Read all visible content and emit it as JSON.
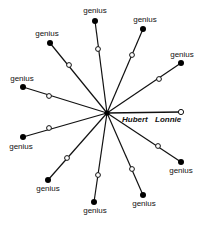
{
  "diagram": {
    "center": {
      "x": 107,
      "y": 113
    },
    "center_person": {
      "labels": [
        "Hubert",
        "Lonnie"
      ],
      "end": {
        "x": 181,
        "y": 112
      }
    },
    "spokes": [
      {
        "label": "genius",
        "dot": {
          "x": 95,
          "y": 21
        },
        "open": {
          "x": 98,
          "y": 49
        },
        "label_pos": {
          "x": 95,
          "y": 13
        },
        "anchor": "middle"
      },
      {
        "label": "genius",
        "dot": {
          "x": 143,
          "y": 29
        },
        "open": {
          "x": 132,
          "y": 55
        },
        "label_pos": {
          "x": 145,
          "y": 22
        },
        "anchor": "middle"
      },
      {
        "label": "genius",
        "dot": {
          "x": 181,
          "y": 63
        },
        "open": {
          "x": 159,
          "y": 79
        },
        "label_pos": {
          "x": 182,
          "y": 57
        },
        "anchor": "middle"
      },
      {
        "label": "genius",
        "dot": {
          "x": 50,
          "y": 43
        },
        "open": {
          "x": 69,
          "y": 65
        },
        "label_pos": {
          "x": 47,
          "y": 36
        },
        "anchor": "middle"
      },
      {
        "label": "genius",
        "dot": {
          "x": 23,
          "y": 87
        },
        "open": {
          "x": 49,
          "y": 96
        },
        "label_pos": {
          "x": 22,
          "y": 81
        },
        "anchor": "middle"
      },
      {
        "label": "genius",
        "dot": {
          "x": 23,
          "y": 137
        },
        "open": {
          "x": 49,
          "y": 128
        },
        "label_pos": {
          "x": 21,
          "y": 149
        },
        "anchor": "middle"
      },
      {
        "label": "genius",
        "dot": {
          "x": 48,
          "y": 180
        },
        "open": {
          "x": 67,
          "y": 158
        },
        "label_pos": {
          "x": 48,
          "y": 191
        },
        "anchor": "middle"
      },
      {
        "label": "genius",
        "dot": {
          "x": 94,
          "y": 202
        },
        "open": {
          "x": 98,
          "y": 175
        },
        "label_pos": {
          "x": 95,
          "y": 213
        },
        "anchor": "middle"
      },
      {
        "label": "genius",
        "dot": {
          "x": 143,
          "y": 195
        },
        "open": {
          "x": 132,
          "y": 169
        },
        "label_pos": {
          "x": 144,
          "y": 206
        },
        "anchor": "middle"
      },
      {
        "label": "genius",
        "dot": {
          "x": 181,
          "y": 162
        },
        "open": {
          "x": 158,
          "y": 146
        },
        "label_pos": {
          "x": 181,
          "y": 173
        },
        "anchor": "middle"
      }
    ]
  }
}
